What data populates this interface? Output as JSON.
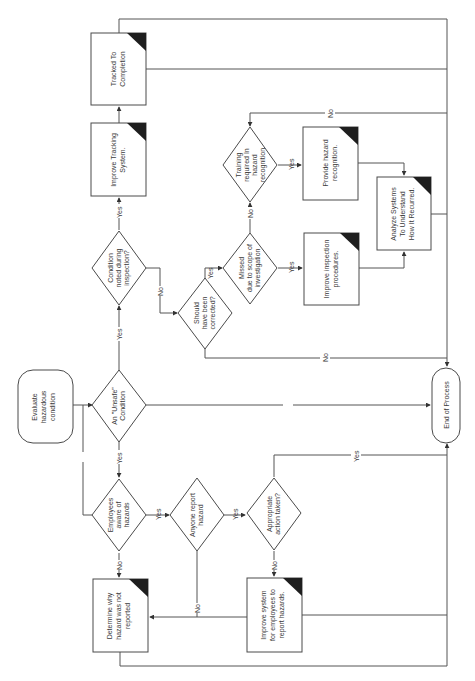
{
  "diagram": {
    "orientation": "rotated-90-ccw",
    "colors": {
      "line": "#555555",
      "text": "#3a3a3a",
      "corner_flag": "#1e1e1e",
      "background": "#ffffff"
    },
    "nodes": {
      "evaluate": {
        "type": "terminator",
        "lines": [
          "Evaluate",
          "hazardous",
          "condition"
        ]
      },
      "unsafe": {
        "type": "decision",
        "lines": [
          "An \"Unsafe\"",
          "Condition"
        ]
      },
      "condition_noted": {
        "type": "decision",
        "lines": [
          "Condition",
          "noted during",
          "inspection?"
        ]
      },
      "improve_tracking": {
        "type": "process",
        "lines": [
          "Improve Tracking",
          "System."
        ]
      },
      "tracked": {
        "type": "process",
        "lines": [
          "Tracked To",
          "Completion"
        ]
      },
      "should_corrected": {
        "type": "decision",
        "lines": [
          "Should",
          "have been",
          "corrected?"
        ]
      },
      "missed": {
        "type": "decision",
        "lines": [
          "Missed",
          "due to scope of",
          "investigation"
        ]
      },
      "training": {
        "type": "decision",
        "lines": [
          "Training",
          "required In",
          "hazard",
          "recognition"
        ]
      },
      "provide_hazard": {
        "type": "process",
        "lines": [
          "Provide hazard",
          "recognition."
        ]
      },
      "improve_inspection": {
        "type": "process",
        "lines": [
          "Improve inspection",
          "procedures."
        ]
      },
      "analyze": {
        "type": "process",
        "lines": [
          "Analyze Systems",
          "To Understand",
          "How It Recurred."
        ]
      },
      "end": {
        "type": "terminator",
        "lines": [
          "End of Process"
        ]
      },
      "employees_aware": {
        "type": "decision",
        "lines": [
          "Employees",
          "aware of",
          "hazards"
        ]
      },
      "anyone_report": {
        "type": "decision",
        "lines": [
          "Anyone report",
          "hazard"
        ]
      },
      "appropriate_action": {
        "type": "decision",
        "lines": [
          "Appropriate",
          "action taken?"
        ]
      },
      "determine_why": {
        "type": "process",
        "lines": [
          "Determine why",
          "hazard was not",
          "reported"
        ]
      },
      "improve_system": {
        "type": "process",
        "lines": [
          "Improve system",
          "for employees to",
          "report hazards."
        ]
      }
    },
    "edge_labels": {
      "unsafe_yes_up": "Yes",
      "unsafe_no_right": "No",
      "unsafe_yes_down": "Yes",
      "evaluate_no_down": "No",
      "noted_yes": "Yes",
      "noted_no": "No",
      "should_yes": "Yes",
      "should_no": "No",
      "missed_yes": "Yes",
      "missed_no": "No",
      "training_yes": "Yes",
      "training_no": "No",
      "employees_yes": "Yes",
      "employees_no": "No",
      "anyone_yes": "Yes",
      "anyone_no": "No",
      "appropriate_yes": "Yes",
      "appropriate_no": "No"
    }
  }
}
